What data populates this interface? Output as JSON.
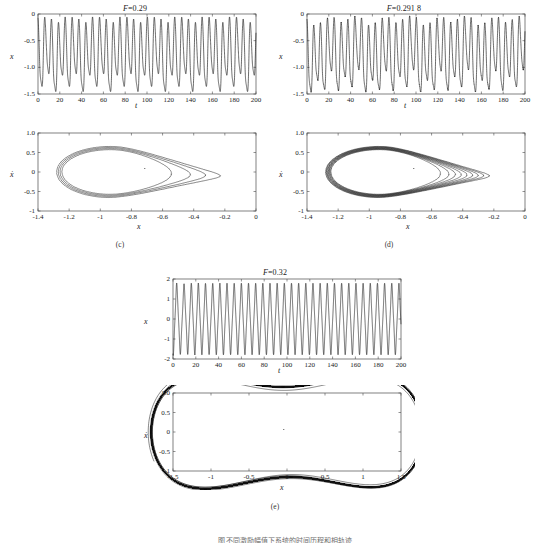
{
  "figure": {
    "caption_partial": "图  不同激励幅值下系统的时间历程和相轨迹",
    "panels": [
      {
        "id": "c",
        "label": "(c)",
        "title_prefix": "F",
        "title_eq": "=",
        "title_value": "0.29",
        "timeseries": {
          "xlabel": "t",
          "ylabel": "x",
          "xlim": [
            0,
            200
          ],
          "ylim": [
            -1.5,
            0
          ],
          "xticks": [
            0,
            20,
            40,
            60,
            80,
            100,
            120,
            140,
            160,
            180,
            200
          ],
          "yticks": [
            0,
            -0.5,
            -1.0,
            -1.5
          ],
          "ytick_labels": [
            "0",
            "-0.5",
            "-1.0",
            "-1.5"
          ]
        },
        "phase": {
          "xlabel": "x",
          "ylabel": "ẋ",
          "xlim": [
            -1.4,
            0
          ],
          "ylim": [
            -1,
            1
          ],
          "xticks": [
            -1.4,
            -1.2,
            -1,
            -0.8,
            -0.6,
            -0.4,
            -0.2,
            0
          ],
          "xtick_labels": [
            "-1.4",
            "-1.2",
            "-1",
            "-0.8",
            "-0.6",
            "-0.4",
            "-0.2",
            "0"
          ],
          "yticks": [
            1.0,
            0.5,
            0,
            -0.5,
            -1
          ],
          "ytick_labels": [
            "1.0",
            "0.5",
            "0",
            "-0.5",
            "-1"
          ]
        }
      },
      {
        "id": "d",
        "label": "(d)",
        "title_prefix": "F",
        "title_eq": "=",
        "title_value": "0.291 8",
        "timeseries": {
          "xlabel": "t",
          "ylabel": "x",
          "xlim": [
            0,
            200
          ],
          "ylim": [
            -1.5,
            0
          ],
          "xticks": [
            0,
            20,
            40,
            60,
            80,
            100,
            120,
            140,
            160,
            180,
            200
          ],
          "yticks": [
            0,
            -0.5,
            -1.0,
            -1.5
          ],
          "ytick_labels": [
            "0",
            "-0.5",
            "-1.0",
            "-1.5"
          ]
        },
        "phase": {
          "xlabel": "x",
          "ylabel": "ẋ",
          "xlim": [
            -1.4,
            0
          ],
          "ylim": [
            -1,
            1
          ],
          "xticks": [
            -1.4,
            -1.2,
            -1,
            -0.8,
            -0.6,
            -0.4,
            -0.2,
            0
          ],
          "xtick_labels": [
            "-1.4",
            "-1.2",
            "-1",
            "-0.8",
            "-0.6",
            "-0.4",
            "-0.2",
            "0"
          ],
          "yticks": [
            1.0,
            0.5,
            0,
            -0.5,
            -1
          ],
          "ytick_labels": [
            "1.0",
            "0.5",
            "0",
            "-0.5",
            "-1"
          ]
        }
      },
      {
        "id": "e",
        "label": "(e)",
        "title_prefix": "F",
        "title_eq": "=",
        "title_value": "0.32",
        "timeseries": {
          "xlabel": "t",
          "ylabel": "x",
          "xlim": [
            0,
            200
          ],
          "ylim": [
            -2,
            2
          ],
          "xticks": [
            0,
            20,
            40,
            60,
            80,
            100,
            120,
            140,
            160,
            180,
            200
          ],
          "yticks": [
            2,
            1,
            0,
            -1,
            -2
          ],
          "ytick_labels": [
            "2",
            "1",
            "0",
            "-1",
            "-2"
          ]
        },
        "phase": {
          "xlabel": "x",
          "ylabel": "ẋ",
          "xlim": [
            -1.5,
            1.5
          ],
          "ylim": [
            -1,
            1
          ],
          "xticks": [
            -1.5,
            -1,
            -0.5,
            0,
            0.5,
            1,
            1.5
          ],
          "xtick_labels": [
            "-1.5",
            "-1",
            "-0.5",
            "0",
            "0.5",
            "1",
            "1.5"
          ],
          "yticks": [
            1.0,
            0.5,
            0,
            -0.5,
            -1
          ],
          "ytick_labels": [
            "1.0",
            "0.5",
            "0",
            "-0.5",
            "-1"
          ]
        }
      }
    ]
  },
  "chart_data": {
    "type": "line",
    "model": {
      "equation": "xddot + delta*xdot - x + x^3 = F*cos(omega*t)",
      "delta": 0.1,
      "omega": 1.0
    },
    "panels": [
      {
        "id": "c",
        "F": 0.29,
        "regime": "period-4 single-well oscillation",
        "timeseries": {
          "x": "t from 0 to 200",
          "y_range": [
            -1.5,
            0
          ],
          "y_mean": -0.78,
          "peak_high": -0.08,
          "peak_low": -0.42,
          "trough_low": -1.42,
          "trough_high": -1.18,
          "period": 6.283,
          "n_cycles": 32
        },
        "phase": {
          "orbit_count": 4,
          "x_range": [
            -1.38,
            -0.14
          ],
          "xdot_range": [
            -0.68,
            0.67
          ],
          "center": [
            -0.92,
            0.0
          ],
          "note": "four nested loops, widely separated on the right lobe tip"
        }
      },
      {
        "id": "d",
        "F": 0.2918,
        "regime": "period-8 / near-chaotic single-well oscillation",
        "timeseries": {
          "x": "t from 0 to 200",
          "y_range": [
            -1.5,
            0
          ],
          "y_mean": -0.78,
          "peak_high": -0.05,
          "peak_low": -0.4,
          "trough_low": -1.45,
          "trough_high": -1.15,
          "period": 6.283,
          "n_cycles": 32
        },
        "phase": {
          "orbit_count": 8,
          "x_range": [
            -1.39,
            -0.13
          ],
          "xdot_range": [
            -0.7,
            0.68
          ],
          "center": [
            -0.92,
            0.0
          ],
          "note": "eight closely bundled loops, thicker bands than panel (c)"
        }
      },
      {
        "id": "e",
        "F": 0.32,
        "regime": "chaotic cross-well motion",
        "timeseries": {
          "x": "t from 0 to 200",
          "y_range": [
            -2,
            2
          ],
          "max": 1.45,
          "min": -1.6,
          "note": "irregular hopping between positive and negative wells; long dwells near +1 punctuated by excursions to -1.5"
        },
        "phase": {
          "x_range": [
            -1.5,
            1.45
          ],
          "xdot_range": [
            -0.85,
            0.82
          ],
          "wells": [
            -1,
            1
          ],
          "note": "double-lobed strange attractor, dense banding in the right lobe"
        }
      }
    ]
  }
}
